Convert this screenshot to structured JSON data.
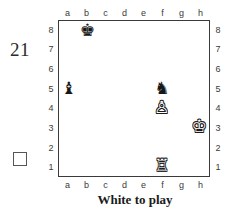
{
  "problem": {
    "number": "21",
    "caption": "White to play",
    "checkbox_checked": false
  },
  "board": {
    "files": [
      "a",
      "b",
      "c",
      "d",
      "e",
      "f",
      "g",
      "h"
    ],
    "ranks": [
      "8",
      "7",
      "6",
      "5",
      "4",
      "3",
      "2",
      "1"
    ],
    "light_square_color": "#ffffff",
    "dark_square_color": "#9a9a9a",
    "border_color": "#3a3a3a",
    "orientation": "white-bottom"
  },
  "chart_data": {
    "type": "table",
    "title": "White to play",
    "subtitle": "21",
    "xlabel": "files",
    "ylabel": "ranks",
    "categories": [
      "a",
      "b",
      "c",
      "d",
      "e",
      "f",
      "g",
      "h"
    ],
    "values": [
      8,
      7,
      6,
      5,
      4,
      3,
      2,
      1
    ],
    "fen": "1k6/8/8/b4n2/5P2/7K/8/5R2 w - - 0 1",
    "side_to_move": "white",
    "pieces": [
      {
        "square": "b8",
        "file": "b",
        "rank": "8",
        "color": "black",
        "type": "king",
        "glyph": "♚",
        "name": "black-king"
      },
      {
        "square": "a5",
        "file": "a",
        "rank": "5",
        "color": "black",
        "type": "bishop",
        "glyph": "♝",
        "name": "black-bishop"
      },
      {
        "square": "f5",
        "file": "f",
        "rank": "5",
        "color": "black",
        "type": "knight",
        "glyph": "♞",
        "name": "black-knight"
      },
      {
        "square": "f4",
        "file": "f",
        "rank": "4",
        "color": "white",
        "type": "pawn",
        "glyph": "♙",
        "name": "white-pawn"
      },
      {
        "square": "h3",
        "file": "h",
        "rank": "3",
        "color": "white",
        "type": "king",
        "glyph": "♔",
        "name": "white-king"
      },
      {
        "square": "f1",
        "file": "f",
        "rank": "1",
        "color": "white",
        "type": "rook",
        "glyph": "♖",
        "name": "white-rook"
      }
    ]
  }
}
